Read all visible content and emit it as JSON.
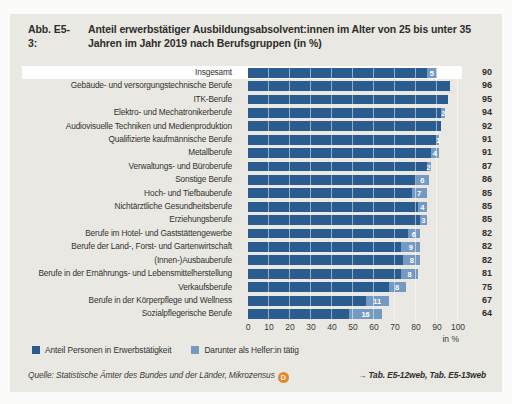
{
  "figure": {
    "label": "Abb. E5-3:",
    "title": "Anteil erwerbstätiger Ausbildungsabsolvent:innen im Alter von 25 bis unter 35 Jahren im Jahr 2019 nach Berufsgruppen (in %)"
  },
  "chart_data": {
    "type": "bar",
    "orientation": "horizontal",
    "categories": [
      "Insgesamt",
      "Gebäude- und versorgungstechnische Berufe",
      "ITK-Berufe",
      "Elektro- und Mechatronikerberufe",
      "Audiovisuelle Techniken und Medienproduktion",
      "Qualifizierte kaufmännische Berufe",
      "Metallberufe",
      "Verwaltungs- und Büroberufe",
      "Sonstige Berufe",
      "Hoch- und Tiefbauberufe",
      "Nichtärztliche Gesundheitsberufe",
      "Erziehungsberufe",
      "Berufe im Hotel- und Gaststättengewerbe",
      "Berufe der Land-, Forst- und Gartenwirtschaft",
      "(Innen-)Ausbauberufe",
      "Berufe in der Ernährungs- und Lebensmittelherstellung",
      "Verkaufsberufe",
      "Berufe in der Körperpflege und Wellness",
      "Sozialpflegerische Berufe"
    ],
    "series": [
      {
        "name": "Anteil Personen in Erwerbstätigkeit",
        "values": [
          90,
          96,
          95,
          94,
          92,
          91,
          91,
          87,
          86,
          85,
          85,
          85,
          82,
          82,
          82,
          81,
          75,
          67,
          64
        ]
      },
      {
        "name": "Darunter als Helfer:in tätig",
        "values": [
          5,
          null,
          null,
          2,
          null,
          1,
          4,
          2,
          6,
          7,
          4,
          3,
          6,
          9,
          8,
          8,
          8,
          11,
          16
        ]
      }
    ],
    "x_ticks": [
      0,
      10,
      20,
      30,
      40,
      50,
      60,
      70,
      80,
      90,
      100
    ],
    "xlim": [
      0,
      100
    ],
    "xlabel": "in %",
    "highlighted_category": "Insgesamt",
    "colors": {
      "employed_bar": "#2b5c8f",
      "helper_bar": "#7499c2",
      "panel_background": "#e9e8e3",
      "highlight_row": "#ffffff",
      "badge_orange": "#e8862b"
    }
  },
  "footer": {
    "source": "Quelle: Statistische Ämter des Bundes und der Länder, Mikrozensus",
    "data_badge": "D",
    "links": "→ Tab. E5-12web, Tab. E5-13web"
  }
}
